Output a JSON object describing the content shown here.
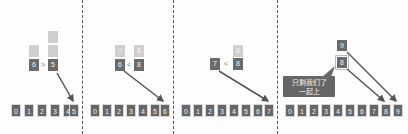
{
  "panels": [
    {
      "left_stack": [
        "",
        "6"
      ],
      "right_stack": [
        "",
        "",
        "5"
      ],
      "comparison": ">",
      "row": [
        "0",
        "1",
        "2",
        "3",
        "4",
        "5"
      ]
    },
    {
      "left_stack": [
        "7",
        "6"
      ],
      "right_stack": [
        "8",
        "8"
      ],
      "comparison": "<",
      "row": [
        "0",
        "1",
        "2",
        "3",
        "4",
        "5",
        "6"
      ]
    },
    {
      "left_stack": [
        "7"
      ],
      "right_stack": [
        "8",
        "8"
      ],
      "comparison": "<",
      "row": [
        "0",
        "1",
        "2",
        "3",
        "4",
        "5",
        "6",
        "7"
      ]
    },
    {
      "stack": [
        "9",
        "8"
      ],
      "speech_bubble": {
        "line1": "只剩我们了",
        "line2": "一起上"
      },
      "row": [
        "0",
        "1",
        "2",
        "3",
        "4",
        "5",
        "6",
        "7",
        "8",
        "9"
      ]
    }
  ],
  "colors": {
    "dark_box": "#666666",
    "light_box": "#cfcfcf",
    "divider": "#555555",
    "arrow": "#555555"
  }
}
